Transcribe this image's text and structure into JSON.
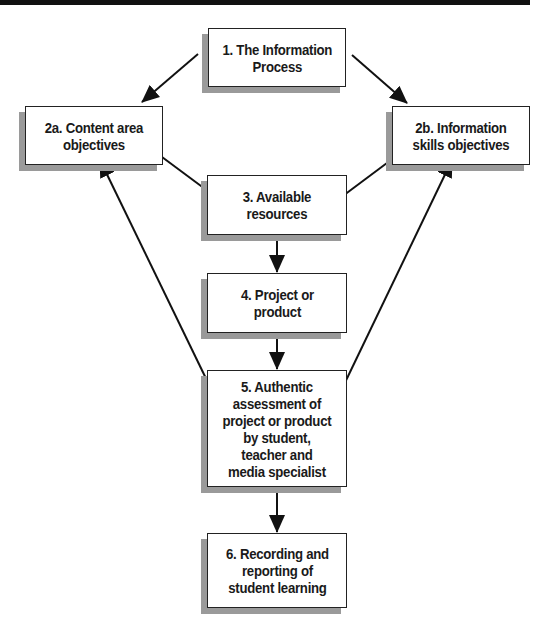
{
  "diagram": {
    "type": "flowchart",
    "colors": {
      "background": "#ffffff",
      "box_fill": "#ffffff",
      "box_border": "#222222",
      "box_shadow": "#9a9a9a",
      "arrow": "#111111",
      "text": "#1a1a1a",
      "top_bar": "#111111"
    },
    "nodes": [
      {
        "id": "1",
        "label": "1. The Information\nProcess"
      },
      {
        "id": "2a",
        "label": "2a. Content area\nobjectives"
      },
      {
        "id": "2b",
        "label": "2b. Information\nskills objectives"
      },
      {
        "id": "3",
        "label": "3. Available\nresources"
      },
      {
        "id": "4",
        "label": "4. Project or\nproduct"
      },
      {
        "id": "5",
        "label": "5. Authentic\nassessment of\nproject or product\nby student,\nteacher and\nmedia specialist"
      },
      {
        "id": "6",
        "label": "6. Recording and\nreporting of\nstudent learning"
      }
    ],
    "edges": [
      {
        "from": "1",
        "to": "2a"
      },
      {
        "from": "1",
        "to": "2b"
      },
      {
        "from": "2a",
        "to": "3"
      },
      {
        "from": "2b",
        "to": "3"
      },
      {
        "from": "3",
        "to": "4"
      },
      {
        "from": "4",
        "to": "5"
      },
      {
        "from": "5",
        "to": "2a"
      },
      {
        "from": "5",
        "to": "2b"
      },
      {
        "from": "5",
        "to": "6"
      }
    ]
  }
}
